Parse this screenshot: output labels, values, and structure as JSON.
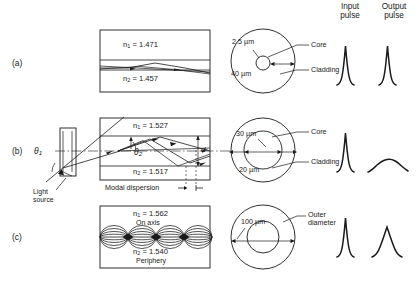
{
  "figure": {
    "headers": {
      "input_pulse": "Input\npulse",
      "input_pulse_line1": "Input",
      "input_pulse_line2": "pulse",
      "output_pulse_line1": "Output",
      "output_pulse_line2": "pulse"
    },
    "row_labels": [
      "(a)",
      "(b)",
      "(c)"
    ]
  },
  "rows": [
    {
      "id": "a",
      "label": "(a)",
      "fiber_type": "single-mode step-index",
      "waveguide": {
        "n1_label": "n1 = 1.471",
        "n1_symbol": "n",
        "n1_sub": "1",
        "n1_value": "= 1.471",
        "n2_symbol": "n",
        "n2_sub": "2",
        "n2_value": "= 1.457",
        "n2_label": "n2 = 1.457",
        "core_index": 1.471,
        "cladding_index": 1.457
      },
      "cross_section": {
        "core_dim": "2.5 µm",
        "cladding_dim": "40 µm",
        "core_callout": "Core",
        "cladding_callout": "Cladding"
      },
      "pulses": {
        "input": "narrow sharp peak",
        "output": "narrow sharp peak"
      }
    },
    {
      "id": "b",
      "label": "(b)",
      "fiber_type": "multimode step-index",
      "waveguide": {
        "n1_symbol": "n",
        "n1_sub": "1",
        "n1_value": "= 1.527",
        "n1_label": "n1 = 1.527",
        "n2_symbol": "n",
        "n2_sub": "2",
        "n2_value": "= 1.517",
        "n2_label": "n2 = 1.517",
        "core_index": 1.527,
        "cladding_index": 1.517,
        "theta1": "θ",
        "theta1_sub": "1",
        "theta2": "θ",
        "theta2_sub": "2",
        "diameter_label": "d",
        "dispersion_label": "Modal dispersion",
        "source_line1": "Light",
        "source_line2": "source"
      },
      "cross_section": {
        "core_dim": "30 µm",
        "cladding_dim": "20 µm",
        "core_callout": "Core",
        "cladding_callout": "Cladding"
      },
      "pulses": {
        "input": "narrow sharp peak",
        "output": "very broad low flattened pulse"
      }
    },
    {
      "id": "c",
      "label": "(c)",
      "fiber_type": "graded-index",
      "waveguide": {
        "n1_symbol": "n",
        "n1_sub": "1",
        "n1_value": "= 1.562",
        "n1_label": "n1 = 1.562",
        "n1_note": "On axis",
        "n2_symbol": "n",
        "n2_sub": "2",
        "n2_value": "= 1.540",
        "n2_label": "n2 = 1.540",
        "n2_note": "Periphery",
        "core_index": 1.562,
        "cladding_index": 1.54
      },
      "cross_section": {
        "core_dim": "100 µm",
        "outer_callout_line1": "Outer",
        "outer_callout_line2": "diameter"
      },
      "pulses": {
        "input": "narrow sharp peak",
        "output": "moderately broadened peak"
      }
    }
  ],
  "colors": {
    "ink": "#1a1a1a",
    "background": "#ffffff"
  }
}
